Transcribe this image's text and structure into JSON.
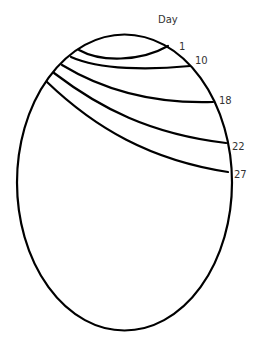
{
  "diagram": {
    "axis_title": "Day",
    "colors": {
      "stroke": "#000000",
      "text": "#333333",
      "background": "#ffffff"
    },
    "outline": {
      "shape": "ellipse",
      "cx": 124.5,
      "cy": 182.5,
      "rx": 107.5,
      "ry": 148
    },
    "lines": [
      {
        "label": "1",
        "path": "M79,50 C100,62 140,62 168,46",
        "label_x": 179,
        "label_y": 50
      },
      {
        "label": "10",
        "path": "M71,57 C100,70 150,70 190,66",
        "label_x": 195,
        "label_y": 64
      },
      {
        "label": "18",
        "path": "M62,65 C100,88 150,104 213,102",
        "label_x": 219,
        "label_y": 104
      },
      {
        "label": "22",
        "path": "M54,73 C100,108 150,134 226,143",
        "label_x": 232,
        "label_y": 150
      },
      {
        "label": "27",
        "path": "M47,82 C95,128 150,160 228,172",
        "label_x": 234,
        "label_y": 178
      }
    ]
  }
}
